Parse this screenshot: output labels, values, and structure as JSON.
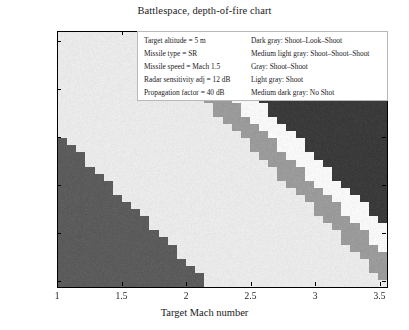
{
  "chart_data": {
    "type": "heatmap",
    "title": "Battlespace, depth-of-fire chart",
    "xlabel": "Target Mach number",
    "ylabel": "Target RCS (dBsm)",
    "xlim": [
      1,
      3.55
    ],
    "ylim": [
      -26,
      0.5
    ],
    "y_axis_inverted": true,
    "grid": false,
    "xticks": [
      1,
      1.5,
      2,
      2.5,
      3,
      3.5
    ],
    "xtick_labels": [
      "1",
      "1.5",
      "2",
      "2.5",
      "3",
      "3.5"
    ],
    "yticks": [
      -25,
      -20,
      -15,
      -10,
      -5,
      0
    ],
    "ytick_labels": [
      "-25",
      "-20",
      "-15",
      "-10",
      "-5",
      "0"
    ],
    "categories": [
      "Shoot-Look-Shoot",
      "Shoot-Shoot-Shoot",
      "Shoot-Shoot",
      "Shoot",
      "No Shot"
    ],
    "category_colors": [
      "#3a3a3a",
      "#f7f7f7",
      "#9a9a9a",
      "#e9e9e9",
      "#5b5b5b"
    ],
    "cell_size": {
      "x": 0.0708,
      "y": 0.708
    },
    "band_boundaries": {
      "note": "Each band edge is a descending staircase; value is cell index count along x where the band starts for a given y row.",
      "noshot_region": "lower-left wedge, medium dark gray",
      "slslshoot_region": "upper-right wedge, dark gray"
    }
  },
  "legend": {
    "parameters": [
      "Target altitude = 5 m",
      "Missile type = SR",
      "Missile speed = Mach 1.5",
      "Radar sensitivity adj = 12 dB",
      "Propagation factor = 40 dB"
    ],
    "keys": [
      "Dark gray: Shoot–Look–Shoot",
      "Medium light gray: Shoot–Shoot–Shoot",
      "Gray: Shoot–Shoot",
      "Light gray: Shoot",
      "Medium dark gray: No Shot"
    ]
  }
}
